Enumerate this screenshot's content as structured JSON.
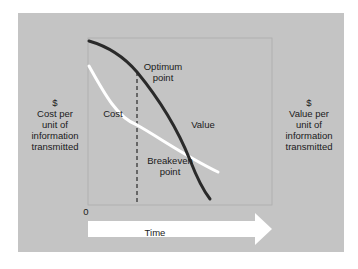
{
  "diagram": {
    "y_axis_left_label": {
      "symbol": "$",
      "lines": [
        "Cost per",
        "unit of",
        "information",
        "transmitted"
      ]
    },
    "y_axis_right_label": {
      "symbol": "$",
      "lines": [
        "Value per",
        "unit of",
        "information",
        "transmitted"
      ]
    },
    "origin_label": "0",
    "x_axis_label": "Time",
    "curves": [
      {
        "name": "Cost",
        "color": "#ffffff",
        "trend": "decreasing"
      },
      {
        "name": "Value",
        "color": "#2a2a2a",
        "trend": "decreasing, steeper"
      }
    ],
    "annotations": {
      "optimum": [
        "Optimum",
        "point"
      ],
      "breakeven": [
        "Breakeven",
        "point"
      ]
    },
    "colors": {
      "panel_background": "#c4c4c4",
      "value_curve": "#2a2a2a",
      "cost_curve": "#ffffff",
      "arrow": "#ffffff",
      "dashed_line": "#2a2a2a"
    }
  }
}
